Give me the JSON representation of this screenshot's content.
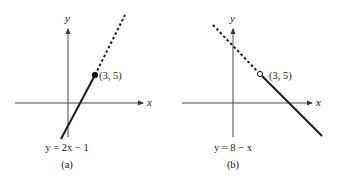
{
  "figures": [
    {
      "id": "a",
      "caption": "(a)",
      "equation": "y = 2x − 1",
      "axis_x_label": "x",
      "axis_y_label": "y",
      "point_label": "(3, 5)",
      "point_style": "filled",
      "solid_segment": "x ≤ 3",
      "dashed_segment": "x > 3"
    },
    {
      "id": "b",
      "caption": "(b)",
      "equation": "y = 8 − x",
      "axis_x_label": "x",
      "axis_y_label": "y",
      "point_label": "(3, 5)",
      "point_style": "open",
      "solid_segment": "x > 3",
      "dashed_segment": "x ≤ 3"
    }
  ],
  "colors": {
    "axis": "#333333",
    "line": "#1a1a1a",
    "text": "#222222"
  }
}
